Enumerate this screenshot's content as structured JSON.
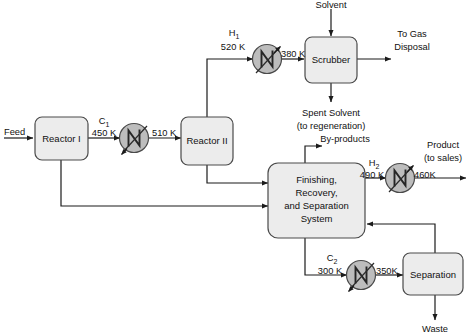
{
  "diagram": {
    "units": [
      {
        "id": "reactor1",
        "label": "Reactor I"
      },
      {
        "id": "reactor2",
        "label": "Reactor II"
      },
      {
        "id": "scrubber",
        "label": "Scrubber"
      },
      {
        "id": "separation",
        "label": "Separation"
      }
    ],
    "finishing_unit": {
      "line1": "Finishing,",
      "line2": "Recovery,",
      "line3": "and Separation",
      "line4": "System"
    },
    "exchangers": [
      {
        "id": "C1",
        "tag": "C",
        "sub": "1",
        "inlet_temp": "450 K",
        "outlet_temp": "510 K",
        "kind": "cooler"
      },
      {
        "id": "H1",
        "tag": "H",
        "sub": "1",
        "inlet_temp": "520 K",
        "outlet_temp": "380 K",
        "kind": "heater"
      },
      {
        "id": "H2",
        "tag": "H",
        "sub": "2",
        "inlet_temp": "490 K",
        "outlet_temp": "460K",
        "kind": "heater"
      },
      {
        "id": "C2",
        "tag": "C",
        "sub": "2",
        "inlet_temp": "300 K",
        "outlet_temp": "350K",
        "kind": "cooler"
      }
    ],
    "streams": {
      "feed": "Feed",
      "solvent": "Solvent",
      "to_gas_line1": "To Gas",
      "to_gas_line2": "Disposal",
      "spent_solvent_line1": "Spent Solvent",
      "spent_solvent_line2": "(to regeneration)",
      "byproducts": "By-products",
      "product_line1": "Product",
      "product_line2": "(to sales)",
      "waste": "Waste"
    },
    "temperatures": {
      "c1_in": "450 K",
      "c1_out": "510 K",
      "h1_in": "520 K",
      "h1_out": "380 K",
      "h2_in": "490 K",
      "h2_out": "460K",
      "c2_in": "300 K",
      "c2_out": "350K"
    },
    "tags": {
      "c1": "C",
      "c1_sub": "1",
      "h1": "H",
      "h1_sub": "1",
      "h2": "H",
      "h2_sub": "2",
      "c2": "C",
      "c2_sub": "2"
    },
    "colors": {
      "unit_fill": "#ececec",
      "exchanger_fill": "#bdbdbd",
      "line": "#1b1b1b",
      "text": "#111111",
      "background": "#ffffff"
    }
  }
}
